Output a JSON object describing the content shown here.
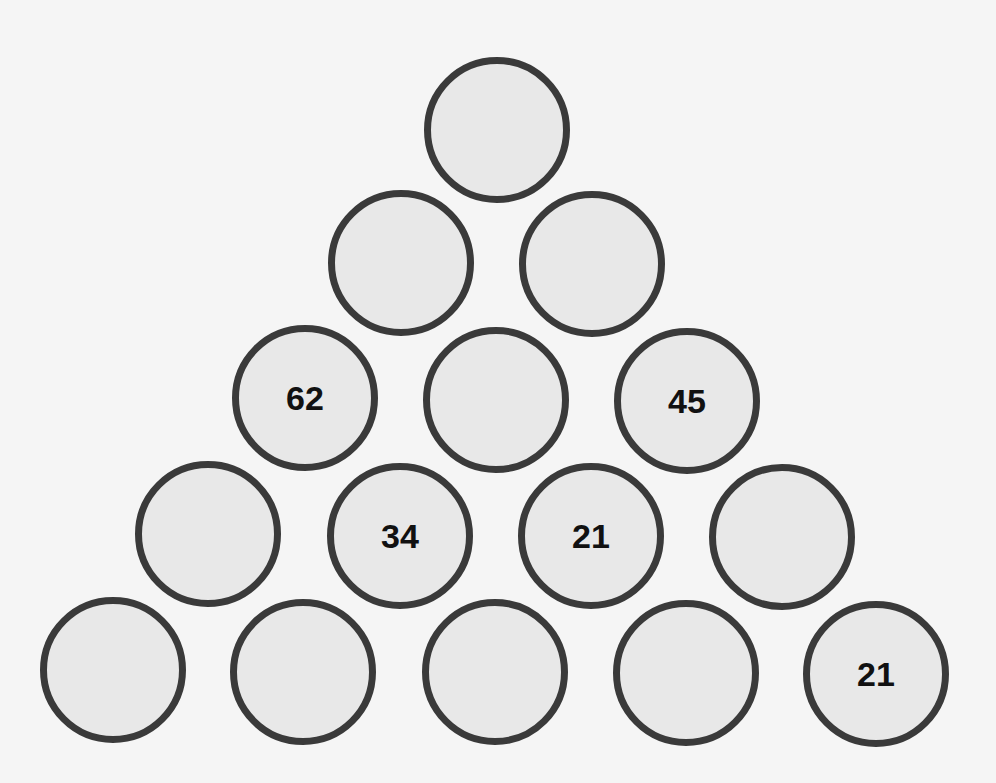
{
  "puzzle": {
    "title": "Number pyramid",
    "colors": {
      "background": "#f5f5f5",
      "circle_fill": "#e8e8e8",
      "circle_stroke": "#3a3a3a",
      "text": "#111111"
    },
    "rows": [
      [
        ""
      ],
      [
        "",
        ""
      ],
      [
        "62",
        "",
        "45"
      ],
      [
        "",
        "34",
        "21",
        ""
      ],
      [
        "",
        "",
        "",
        "",
        "21"
      ]
    ],
    "cells": [
      {
        "row": 1,
        "col": 1,
        "cx": 497,
        "cy": 130,
        "value": ""
      },
      {
        "row": 2,
        "col": 1,
        "cx": 401,
        "cy": 263,
        "value": ""
      },
      {
        "row": 2,
        "col": 2,
        "cx": 592,
        "cy": 264,
        "value": ""
      },
      {
        "row": 3,
        "col": 1,
        "cx": 305,
        "cy": 398,
        "value": "62"
      },
      {
        "row": 3,
        "col": 2,
        "cx": 496,
        "cy": 400,
        "value": ""
      },
      {
        "row": 3,
        "col": 3,
        "cx": 687,
        "cy": 401,
        "value": "45"
      },
      {
        "row": 4,
        "col": 1,
        "cx": 208,
        "cy": 534,
        "value": ""
      },
      {
        "row": 4,
        "col": 2,
        "cx": 400,
        "cy": 536,
        "value": "34"
      },
      {
        "row": 4,
        "col": 3,
        "cx": 591,
        "cy": 536,
        "value": "21"
      },
      {
        "row": 4,
        "col": 4,
        "cx": 782,
        "cy": 537,
        "value": ""
      },
      {
        "row": 5,
        "col": 1,
        "cx": 113,
        "cy": 670,
        "value": ""
      },
      {
        "row": 5,
        "col": 2,
        "cx": 303,
        "cy": 672,
        "value": ""
      },
      {
        "row": 5,
        "col": 3,
        "cx": 495,
        "cy": 672,
        "value": ""
      },
      {
        "row": 5,
        "col": 4,
        "cx": 686,
        "cy": 673,
        "value": ""
      },
      {
        "row": 5,
        "col": 5,
        "cx": 876,
        "cy": 674,
        "value": "21"
      }
    ]
  }
}
